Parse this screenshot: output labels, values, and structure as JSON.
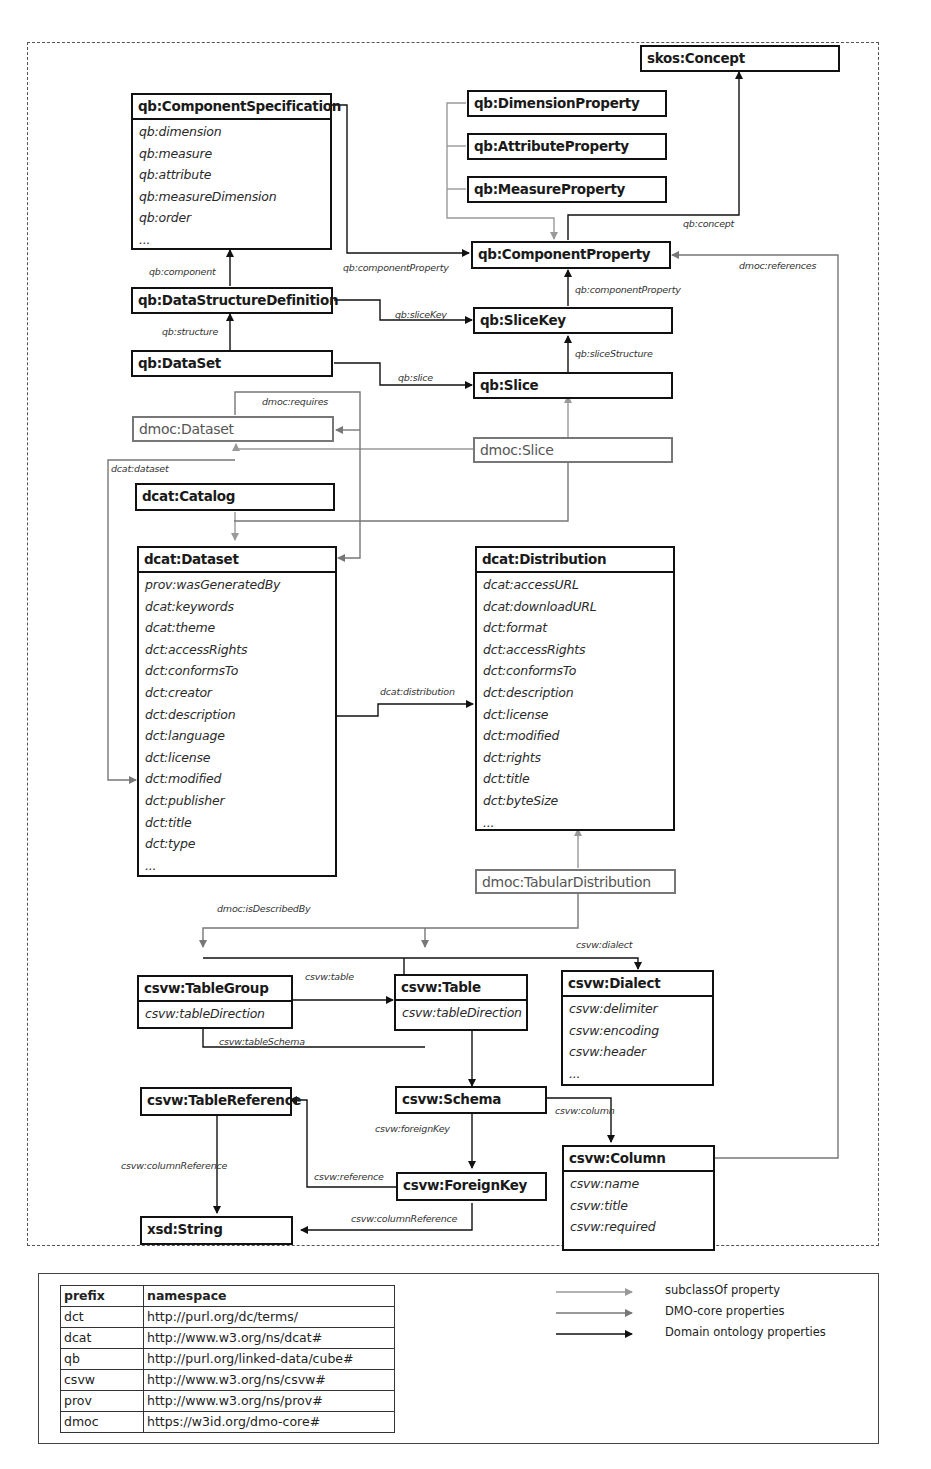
{
  "diagram": {
    "colors": {
      "domain_property": "#111111",
      "dmo_core_property": "#777777",
      "subclass_of": "#999999"
    },
    "classes": {
      "skos_concept": {
        "title": "skos:Concept"
      },
      "qb_component_specification": {
        "title": "qb:ComponentSpecification",
        "attributes": [
          "qb:dimension",
          "qb:measure",
          "qb:attribute",
          "qb:measureDimension",
          "qb:order",
          "..."
        ]
      },
      "qb_dimension_property": {
        "title": "qb:DimensionProperty"
      },
      "qb_attribute_property": {
        "title": "qb:AttributeProperty"
      },
      "qb_measure_property": {
        "title": "qb:MeasureProperty"
      },
      "qb_component_property": {
        "title": "qb:ComponentProperty"
      },
      "qb_data_structure_definition": {
        "title": "qb:DataStructureDefinition"
      },
      "qb_slice_key": {
        "title": "qb:SliceKey"
      },
      "qb_dataset": {
        "title": "qb:DataSet"
      },
      "qb_slice": {
        "title": "qb:Slice"
      },
      "dmoc_dataset": {
        "title": "dmoc:Dataset"
      },
      "dmoc_slice": {
        "title": "dmoc:Slice"
      },
      "dcat_catalog": {
        "title": "dcat:Catalog"
      },
      "dcat_dataset": {
        "title": "dcat:Dataset",
        "attributes": [
          "prov:wasGeneratedBy",
          "dcat:keywords",
          "dcat:theme",
          "dct:accessRights",
          "dct:conformsTo",
          "dct:creator",
          "dct:description",
          "dct:language",
          "dct:license",
          "dct:modified",
          "dct:publisher",
          "dct:title",
          "dct:type",
          "..."
        ]
      },
      "dcat_distribution": {
        "title": "dcat:Distribution",
        "attributes": [
          "dcat:accessURL",
          "dcat:downloadURL",
          "dct:format",
          "dct:accessRights",
          "dct:conformsTo",
          "dct:description",
          "dct:license",
          "dct:modified",
          "dct:rights",
          "dct:title",
          "dct:byteSize",
          "..."
        ]
      },
      "dmoc_tabular_distribution": {
        "title": "dmoc:TabularDistribution"
      },
      "csvw_table_group": {
        "title": "csvw:TableGroup",
        "attributes": [
          "csvw:tableDirection"
        ]
      },
      "csvw_table": {
        "title": "csvw:Table",
        "attributes": [
          "csvw:tableDirection"
        ]
      },
      "csvw_dialect": {
        "title": "csvw:Dialect",
        "attributes": [
          "csvw:delimiter",
          "csvw:encoding",
          "csvw:header",
          "..."
        ]
      },
      "csvw_table_reference": {
        "title": "csvw:TableReference"
      },
      "csvw_schema": {
        "title": "csvw:Schema"
      },
      "csvw_foreign_key": {
        "title": "csvw:ForeignKey"
      },
      "csvw_column": {
        "title": "csvw:Column",
        "attributes": [
          "csvw:name",
          "csvw:title",
          "csvw:required"
        ]
      },
      "xsd_string": {
        "title": "xsd:String"
      }
    },
    "edge_labels": {
      "qb_concept": "qb:concept",
      "qb_component_property_1": "qb:componentProperty",
      "qb_component_property_2": "qb:componentProperty",
      "dmoc_references": "dmoc:references",
      "qb_component": "qb:component",
      "qb_slice_key": "qb:sliceKey",
      "qb_structure": "qb:structure",
      "qb_slice_structure": "qb:sliceStructure",
      "qb_slice": "qb:slice",
      "dmoc_requires": "dmoc:requires",
      "dcat_dataset": "dcat:dataset",
      "dcat_distribution": "dcat:distribution",
      "dmoc_is_described_by": "dmoc:isDescribedBy",
      "csvw_dialect": "csvw:dialect",
      "csvw_table": "csvw:table",
      "csvw_table_schema": "csvw:tableSchema",
      "csvw_column": "csvw:column",
      "csvw_foreign_key": "csvw:foreignKey",
      "csvw_reference": "csvw:reference",
      "csvw_column_reference_1": "csvw:columnReference",
      "csvw_column_reference_2": "csvw:columnReference"
    }
  },
  "namespace_table": {
    "headers": [
      "prefix",
      "namespace"
    ],
    "rows": [
      [
        "dct",
        "http://purl.org/dc/terms/"
      ],
      [
        "dcat",
        "http://www.w3.org/ns/dcat#"
      ],
      [
        "qb",
        "http://purl.org/linked-data/cube#"
      ],
      [
        "csvw",
        "http://www.w3.org/ns/csvw#"
      ],
      [
        "prov",
        "http://www.w3.org/ns/prov#"
      ],
      [
        "dmoc",
        "https://w3id.org/dmo-core#"
      ]
    ]
  },
  "legend": {
    "items": [
      {
        "label": "subclassOf property",
        "color": "#999999"
      },
      {
        "label": "DMO-core properties",
        "color": "#777777"
      },
      {
        "label": "Domain ontology properties",
        "color": "#111111"
      }
    ]
  }
}
